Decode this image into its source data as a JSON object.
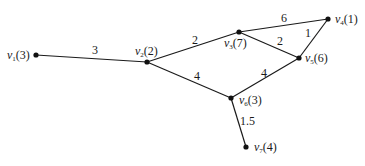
{
  "diagram": {
    "type": "weighted-graph",
    "nodes": [
      {
        "id": "v1",
        "name": "v",
        "sub": "1",
        "value": "(3)",
        "x": 36,
        "y": 55,
        "lx": 7,
        "ly": 59
      },
      {
        "id": "v2",
        "name": "v",
        "sub": "2",
        "value": "(2)",
        "x": 147,
        "y": 62,
        "lx": 135,
        "ly": 55
      },
      {
        "id": "v3",
        "name": "v",
        "sub": "3",
        "value": "(7)",
        "x": 239,
        "y": 32,
        "lx": 224,
        "ly": 47
      },
      {
        "id": "v4",
        "name": "v",
        "sub": "4",
        "value": "(1)",
        "x": 328,
        "y": 19,
        "lx": 335,
        "ly": 23
      },
      {
        "id": "v5",
        "name": "v",
        "sub": "5",
        "value": "(6)",
        "x": 299,
        "y": 58,
        "lx": 305,
        "ly": 62
      },
      {
        "id": "v6",
        "name": "v",
        "sub": "6",
        "value": "(3)",
        "x": 231,
        "y": 98,
        "lx": 239,
        "ly": 104
      },
      {
        "id": "v7",
        "name": "v",
        "sub": "7",
        "value": "(4)",
        "x": 246,
        "y": 147,
        "lx": 254,
        "ly": 151
      }
    ],
    "edges": [
      {
        "from": "v1",
        "to": "v2",
        "weight": "3",
        "lx": 92,
        "ly": 54
      },
      {
        "from": "v2",
        "to": "v3",
        "weight": "2",
        "lx": 192,
        "ly": 44
      },
      {
        "from": "v3",
        "to": "v4",
        "weight": "6",
        "lx": 281,
        "ly": 22
      },
      {
        "from": "v3",
        "to": "v5",
        "weight": "2",
        "lx": 277,
        "ly": 45
      },
      {
        "from": "v4",
        "to": "v5",
        "weight": "1",
        "lx": 305,
        "ly": 37
      },
      {
        "from": "v2",
        "to": "v6",
        "weight": "4",
        "lx": 194,
        "ly": 80
      },
      {
        "from": "v5",
        "to": "v6",
        "weight": "4",
        "lx": 261,
        "ly": 77
      },
      {
        "from": "v6",
        "to": "v7",
        "weight": "1.5",
        "lx": 240,
        "ly": 125
      }
    ]
  }
}
